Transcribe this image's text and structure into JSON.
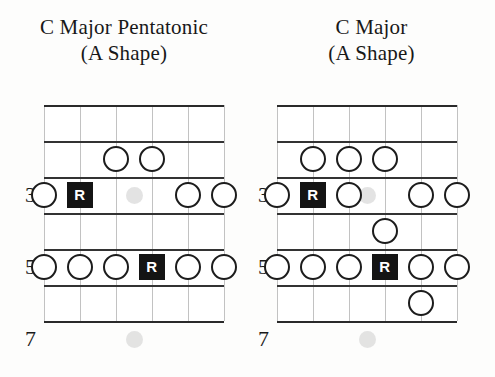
{
  "page": {
    "background_color": "#fdfdfc",
    "ink_color": "#1a1a1a"
  },
  "diagrams": [
    {
      "id": "c-major-pentatonic",
      "title_line1": "C Major Pentatonic",
      "title_line2": "(A Shape)",
      "grid": {
        "strings": 6,
        "frets": 6,
        "fret_labels": [
          "3",
          "5",
          "7"
        ],
        "fret_label_rows": [
          3,
          5,
          7
        ],
        "inlay_frets": [
          3,
          7
        ],
        "inlay_string_gap": 3.5
      },
      "notes": [
        {
          "fret": 2,
          "string": 3,
          "type": "open"
        },
        {
          "fret": 2,
          "string": 4,
          "type": "open"
        },
        {
          "fret": 3,
          "string": 1,
          "type": "open"
        },
        {
          "fret": 3,
          "string": 2,
          "type": "root",
          "label": "R"
        },
        {
          "fret": 3,
          "string": 5,
          "type": "open"
        },
        {
          "fret": 3,
          "string": 6,
          "type": "open"
        },
        {
          "fret": 5,
          "string": 1,
          "type": "open"
        },
        {
          "fret": 5,
          "string": 2,
          "type": "open"
        },
        {
          "fret": 5,
          "string": 3,
          "type": "open"
        },
        {
          "fret": 5,
          "string": 4,
          "type": "root",
          "label": "R"
        },
        {
          "fret": 5,
          "string": 5,
          "type": "open"
        },
        {
          "fret": 5,
          "string": 6,
          "type": "open"
        }
      ]
    },
    {
      "id": "c-major",
      "title_line1": "C Major",
      "title_line2": "(A Shape)",
      "grid": {
        "strings": 6,
        "frets": 6,
        "fret_labels": [
          "3",
          "5",
          "7"
        ],
        "fret_label_rows": [
          3,
          5,
          7
        ],
        "inlay_frets": [
          3,
          7
        ],
        "inlay_string_gap": 3.5
      },
      "notes": [
        {
          "fret": 2,
          "string": 2,
          "type": "open"
        },
        {
          "fret": 2,
          "string": 3,
          "type": "open"
        },
        {
          "fret": 2,
          "string": 4,
          "type": "open"
        },
        {
          "fret": 3,
          "string": 1,
          "type": "open"
        },
        {
          "fret": 3,
          "string": 2,
          "type": "root",
          "label": "R"
        },
        {
          "fret": 3,
          "string": 3,
          "type": "open"
        },
        {
          "fret": 3,
          "string": 5,
          "type": "open"
        },
        {
          "fret": 3,
          "string": 6,
          "type": "open"
        },
        {
          "fret": 4,
          "string": 4,
          "type": "open"
        },
        {
          "fret": 5,
          "string": 1,
          "type": "open"
        },
        {
          "fret": 5,
          "string": 2,
          "type": "open"
        },
        {
          "fret": 5,
          "string": 3,
          "type": "open"
        },
        {
          "fret": 5,
          "string": 4,
          "type": "root",
          "label": "R"
        },
        {
          "fret": 5,
          "string": 5,
          "type": "open"
        },
        {
          "fret": 5,
          "string": 6,
          "type": "open"
        },
        {
          "fret": 6,
          "string": 5,
          "type": "open"
        }
      ]
    }
  ],
  "layout": {
    "board_left": [
      44,
      277
    ],
    "board_top": 105,
    "board_width": 180,
    "string_spacing": 36,
    "fret_height": 36,
    "fret_rows": 7
  }
}
